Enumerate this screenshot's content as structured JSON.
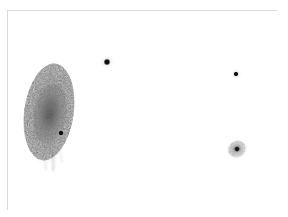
{
  "view": {
    "width": 288,
    "height": 217,
    "background_color": "#ffffff",
    "frame_color": "#d9d9d9",
    "frame": {
      "x": 7,
      "y": 10,
      "width": 270,
      "height": 200
    },
    "colorscale": "inverted-grayscale",
    "caption": ""
  },
  "chart_data": {
    "type": "scatter",
    "title": "",
    "subtitle": "",
    "xlabel": "",
    "ylabel": "",
    "grid": false,
    "legend": "none",
    "xlim": [
      0,
      270
    ],
    "ylim": [
      0,
      200
    ],
    "axis_ticks": [],
    "sources": [
      {
        "id": "extended-galaxy",
        "label": "",
        "kind": "extended-diffuse",
        "x": 41,
        "y": 101,
        "radius_x": 24,
        "radius_y": 48,
        "position_angle_deg": 8,
        "peak_darkness": 0.72,
        "mottled": true
      },
      {
        "id": "embedded-point-source",
        "label": "",
        "kind": "point",
        "x": 53,
        "y": 122,
        "radius": 3.1,
        "peak_darkness": 0.95,
        "halo_radius": 6
      },
      {
        "id": "upper-point-source",
        "label": "",
        "kind": "point",
        "x": 99,
        "y": 51,
        "radius": 3.6,
        "peak_darkness": 0.97,
        "halo_radius": 8
      },
      {
        "id": "right-point-source",
        "label": "",
        "kind": "point",
        "x": 228,
        "y": 63,
        "radius": 2.7,
        "peak_darkness": 0.95,
        "halo_radius": 6
      },
      {
        "id": "compact-galaxy",
        "label": "",
        "kind": "compact-diffuse",
        "x": 229,
        "y": 138,
        "radius_x": 11,
        "radius_y": 10,
        "core_radius": 3.2,
        "peak_darkness": 0.85
      }
    ]
  }
}
